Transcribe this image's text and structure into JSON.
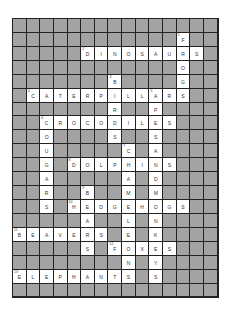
{
  "puzzle": {
    "type": "crossword",
    "rows": 20,
    "cols": 15,
    "colors": {
      "block": "#a3a3a3",
      "cell": "#ffffff",
      "line": "#222222",
      "text": "#333333"
    },
    "grid": [
      "...............",
      "............F..",
      ".....DINOSAURS.",
      "............O..",
      ".......B....G..",
      ".CATERPILLARS..",
      ".......R..P....",
      "..CROCODILES...",
      "..O....S..S....",
      "..U.....C.A....",
      "..G.DOLPHINS...",
      "..A.....A.D....",
      "..R..B..M.M....",
      "..S.HEDGEHOGS..",
      ".....A..L.N....",
      "BEAVERS.E.K....",
      ".....S.FOXES...",
      "........N.Y....",
      "ELEPHANTS.S....",
      "..............."
    ],
    "numbers": [
      {
        "row": 1,
        "col": 12,
        "n": "1"
      },
      {
        "row": 2,
        "col": 5,
        "n": "2"
      },
      {
        "row": 4,
        "col": 7,
        "n": "3"
      },
      {
        "row": 5,
        "col": 1,
        "n": "4"
      },
      {
        "row": 5,
        "col": 10,
        "n": "5"
      },
      {
        "row": 7,
        "col": 2,
        "n": "6"
      },
      {
        "row": 9,
        "col": 8,
        "n": "7"
      },
      {
        "row": 10,
        "col": 4,
        "n": "8"
      },
      {
        "row": 12,
        "col": 5,
        "n": "9"
      },
      {
        "row": 13,
        "col": 4,
        "n": "10"
      },
      {
        "row": 15,
        "col": 0,
        "n": "11"
      },
      {
        "row": 16,
        "col": 7,
        "n": "12"
      },
      {
        "row": 18,
        "col": 0,
        "n": "13"
      }
    ],
    "words": {
      "across": [
        "DINOSAURS",
        "CATERPILLARS",
        "CROCODILES",
        "DOLPHINS",
        "HEDGEHOGS",
        "BEAVERS",
        "FOXES",
        "ELEPHANTS"
      ],
      "down": [
        "FROGS",
        "BIRDS",
        "APESANDMONKEYS",
        "COUGARS",
        "CHAMELEONS",
        "BEARS"
      ]
    }
  }
}
